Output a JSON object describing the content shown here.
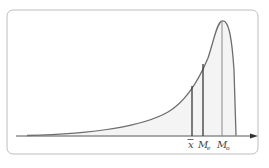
{
  "diagram": {
    "colors": {
      "frame": "#bdbdbd",
      "curve": "#6e6e6e",
      "fill": "#f2f2f2",
      "lines": "#3a3a3a",
      "axis": "#555555"
    },
    "labels": {
      "mean": "x",
      "median_main": "M",
      "median_sub": "e",
      "mode_main": "M",
      "mode_sub": "o"
    },
    "markers": [
      {
        "name": "mean",
        "x": 192,
        "y_top": 86
      },
      {
        "name": "median",
        "x": 203,
        "y_top": 64
      },
      {
        "name": "mode",
        "x": 222,
        "y_top": 21
      }
    ]
  }
}
